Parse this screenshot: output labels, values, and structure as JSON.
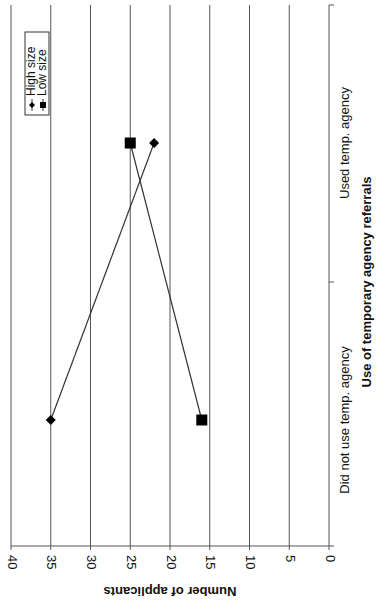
{
  "chart_data": {
    "type": "line",
    "orientation": "rotated 90° clockwise (page shown sideways)",
    "title": "",
    "xlabel": "Use of temporary agency referrals",
    "ylabel": "Number of applicants",
    "categories": [
      "Did not use temp. agency",
      "Used temp. agency"
    ],
    "series": [
      {
        "name": "High size",
        "marker": "diamond",
        "values": [
          35,
          22
        ]
      },
      {
        "name": "Low size",
        "marker": "square",
        "values": [
          16,
          25
        ]
      }
    ],
    "ylim": [
      0,
      40
    ],
    "yticks": [
      0,
      5,
      10,
      15,
      20,
      25,
      30,
      35,
      40
    ],
    "grid": true,
    "legend_position": "upper-left (in rotated view)"
  },
  "axis": {
    "y_tick_labels": [
      "0",
      "5",
      "10",
      "15",
      "20",
      "25",
      "30",
      "35",
      "40"
    ],
    "y_title": "Number of applicants",
    "x_title": "Use of temporary agency referrals",
    "x_tick_labels": [
      "Did not use temp. agency",
      "Used temp. agency"
    ]
  },
  "legend": {
    "items": [
      {
        "label": "High size",
        "marker": "diamond"
      },
      {
        "label": "Low size",
        "marker": "square"
      }
    ]
  },
  "colors": {
    "line": "#333333",
    "grid": "#555555",
    "marker": "#000000",
    "background": "#ffffff"
  }
}
